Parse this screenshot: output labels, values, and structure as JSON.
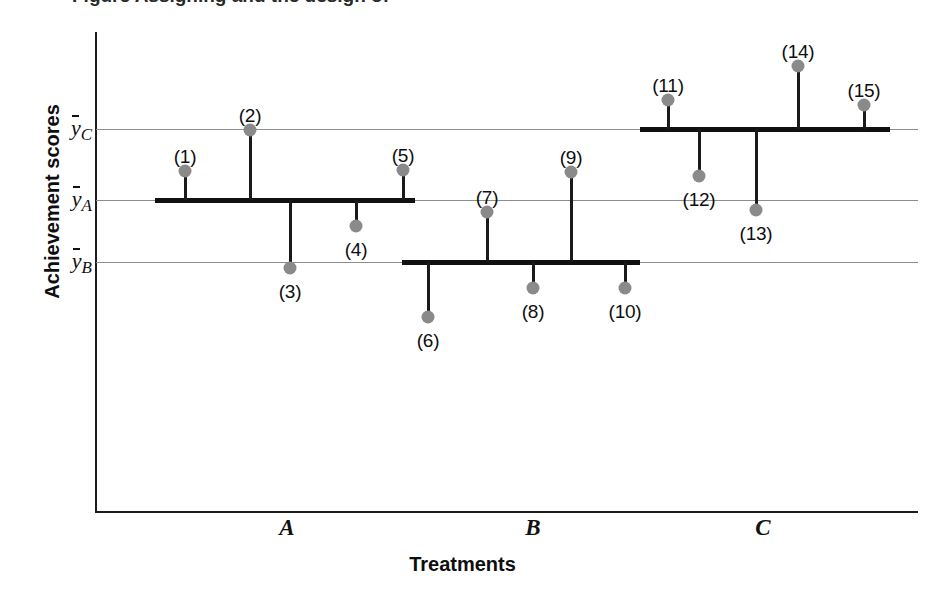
{
  "figure": {
    "clipped_caption": "Figure   Assigning and the design of  ",
    "axis": {
      "y_title": "Achievement scores",
      "x_title": "Treatments"
    }
  },
  "chart_data": {
    "type": "scatter",
    "title": "",
    "xlabel": "Treatments",
    "ylabel": "Achievement scores",
    "grid": false,
    "legend": "none",
    "categories": [
      "A",
      "B",
      "C"
    ],
    "group_means": [
      {
        "id": "A",
        "label": "ȳA",
        "tick_text": "y",
        "subscript": "A",
        "y_px": 200,
        "bar_x_start": 155,
        "bar_x_end": 415
      },
      {
        "id": "B",
        "label": "ȳB",
        "tick_text": "y",
        "subscript": "B",
        "y_px": 262,
        "bar_x_start": 402,
        "bar_x_end": 640
      },
      {
        "id": "C",
        "label": "ȳC",
        "tick_text": "y",
        "subscript": "C",
        "y_px": 129,
        "bar_x_start": 640,
        "bar_x_end": 890
      }
    ],
    "mean_order_top_to_bottom": [
      "ȳC",
      "ȳA",
      "ȳB"
    ],
    "x_tick_positions": [
      287,
      533,
      763
    ],
    "points": [
      {
        "label": "(1)",
        "group": "A",
        "x_px": 185,
        "y_px": 171,
        "label_x": 185,
        "label_y": 146,
        "label_pos": "above"
      },
      {
        "label": "(2)",
        "group": "A",
        "x_px": 250,
        "y_px": 130,
        "label_x": 250,
        "label_y": 105,
        "label_pos": "above"
      },
      {
        "label": "(3)",
        "group": "A",
        "x_px": 290,
        "y_px": 268,
        "label_x": 290,
        "label_y": 281,
        "label_pos": "below"
      },
      {
        "label": "(4)",
        "group": "A",
        "x_px": 356,
        "y_px": 226,
        "label_x": 356,
        "label_y": 239,
        "label_pos": "below"
      },
      {
        "label": "(5)",
        "group": "A",
        "x_px": 403,
        "y_px": 170,
        "label_x": 403,
        "label_y": 145,
        "label_pos": "above"
      },
      {
        "label": "(6)",
        "group": "B",
        "x_px": 428,
        "y_px": 317,
        "label_x": 428,
        "label_y": 330,
        "label_pos": "below"
      },
      {
        "label": "(7)",
        "group": "B",
        "x_px": 487,
        "y_px": 212,
        "label_x": 487,
        "label_y": 187,
        "label_pos": "above"
      },
      {
        "label": "(8)",
        "group": "B",
        "x_px": 533,
        "y_px": 288,
        "label_x": 533,
        "label_y": 301,
        "label_pos": "below"
      },
      {
        "label": "(9)",
        "group": "B",
        "x_px": 571,
        "y_px": 172,
        "label_x": 571,
        "label_y": 147,
        "label_pos": "above"
      },
      {
        "label": "(10)",
        "group": "B",
        "x_px": 625,
        "y_px": 288,
        "label_x": 625,
        "label_y": 301,
        "label_pos": "below"
      },
      {
        "label": "(11)",
        "group": "C",
        "x_px": 668,
        "y_px": 100,
        "label_x": 668,
        "label_y": 75,
        "label_pos": "above"
      },
      {
        "label": "(12)",
        "group": "C",
        "x_px": 699,
        "y_px": 176,
        "label_x": 699,
        "label_y": 189,
        "label_pos": "below"
      },
      {
        "label": "(13)",
        "group": "C",
        "x_px": 756,
        "y_px": 210,
        "label_x": 756,
        "label_y": 223,
        "label_pos": "below"
      },
      {
        "label": "(14)",
        "group": "C",
        "x_px": 798,
        "y_px": 66,
        "label_x": 798,
        "label_y": 41,
        "label_pos": "above"
      },
      {
        "label": "(15)",
        "group": "C",
        "x_px": 864,
        "y_px": 105,
        "label_x": 864,
        "label_y": 80,
        "label_pos": "above"
      }
    ]
  },
  "colors": {
    "dot": "#8a8a8a",
    "stem": "#1a1a1a",
    "group_bar": "#111111",
    "mean_line": "#8d8d8d",
    "axis": "#1c1c1c",
    "background": "#ffffff",
    "text": "#0e0e0e"
  }
}
